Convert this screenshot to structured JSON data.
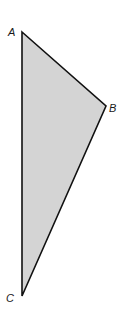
{
  "diagram": {
    "type": "triangle",
    "fill_color": "#d4d4d4",
    "stroke_color": "#111111",
    "vertices": [
      {
        "label": "A",
        "x": 22,
        "y": 32,
        "label_x": 8,
        "label_y": 36
      },
      {
        "label": "B",
        "x": 106,
        "y": 106,
        "label_x": 109,
        "label_y": 112
      },
      {
        "label": "C",
        "x": 22,
        "y": 296,
        "label_x": 6,
        "label_y": 302
      }
    ]
  }
}
